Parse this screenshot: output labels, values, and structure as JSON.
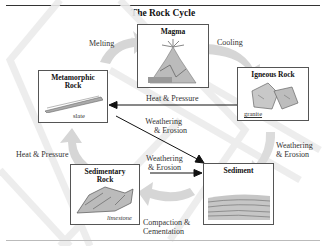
{
  "title": "The Rock Cycle",
  "nodes": {
    "magma": {
      "name": "Magma"
    },
    "metamorphic": {
      "name_line1": "Metamorphic",
      "name_line2": "Rock",
      "sample": "slate"
    },
    "igneous": {
      "name": "Igneous Rock",
      "sample": "granite"
    },
    "sedimentary": {
      "name_line1": "Sedimentary",
      "name_line2": "Rock",
      "sample": "limestone"
    },
    "sediment": {
      "name": "Sediment"
    }
  },
  "processes": {
    "melting": "Melting",
    "cooling": "Cooling",
    "heat_pressure_center": "Heat & Pressure",
    "weathering_center_1a": "Weathering",
    "weathering_center_1b": "& Erosion",
    "weathering_center_2a": "Weathering",
    "weathering_center_2b": "& Erosion",
    "heat_pressure_left": "Heat & Pressure",
    "weathering_right_a": "Weathering",
    "weathering_right_b": "& Erosion",
    "compaction_a": "Compaction &",
    "compaction_b": "Cementation"
  },
  "colors": {
    "rule": "#333333",
    "box_border": "#555555",
    "arrow": "#111111",
    "wide_arrow": "#d4d4d4",
    "watermark": "#e9e9e9"
  }
}
